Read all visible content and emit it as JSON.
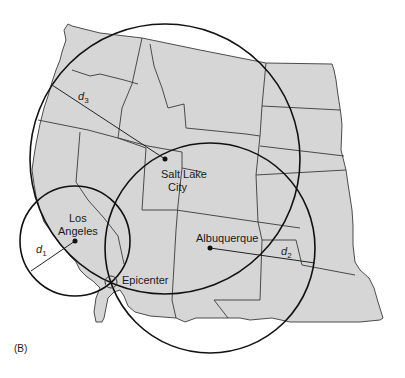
{
  "figure": {
    "panel_label": "(B)",
    "region": "Western United States",
    "map_fill": "#d6d6d6",
    "line_color": "#111111"
  },
  "cities": [
    {
      "name": "Salt Lake City",
      "line1": "Salt Lake",
      "line2": "City",
      "x": 165,
      "y": 159
    },
    {
      "name": "Los Angeles",
      "line1": "Los",
      "line2": "Angeles",
      "x": 75,
      "y": 241
    },
    {
      "name": "Albuquerque",
      "line1": "Albuquerque",
      "x": 210,
      "y": 248
    }
  ],
  "epicenter": {
    "label": "Epicenter",
    "x": 111,
    "y": 282
  },
  "distances": [
    {
      "symbol": "d",
      "subscript": "1",
      "from": "Los Angeles",
      "radius": 55
    },
    {
      "symbol": "d",
      "subscript": "2",
      "from": "Albuquerque",
      "radius": 105
    },
    {
      "symbol": "d",
      "subscript": "3",
      "from": "Salt Lake City",
      "radius": 135
    }
  ]
}
